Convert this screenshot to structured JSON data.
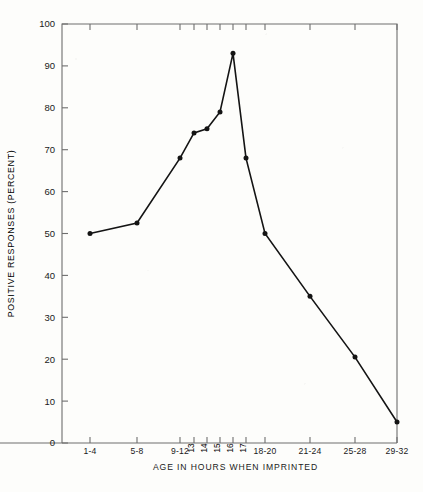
{
  "chart_data": {
    "type": "line",
    "title": "",
    "xlabel": "AGE IN HOURS WHEN IMPRINTED",
    "ylabel": "POSITIVE RESPONSES (PERCENT)",
    "ylim": [
      0,
      100
    ],
    "ytick_values": [
      0,
      10,
      20,
      30,
      40,
      50,
      60,
      70,
      80,
      90,
      100
    ],
    "ytick_labels": [
      "0",
      "10",
      "20",
      "30",
      "40",
      "50",
      "60",
      "70",
      "80",
      "90",
      "100"
    ],
    "grid": false,
    "legend": null,
    "categories": [
      "1-4",
      "5-8",
      "9-12",
      "13",
      "14",
      "15",
      "16",
      "17",
      "18-20",
      "21-24",
      "25-28",
      "29-32"
    ],
    "category_rotated": [
      false,
      false,
      false,
      true,
      true,
      true,
      true,
      true,
      false,
      false,
      false,
      false
    ],
    "values": [
      50,
      52.5,
      68,
      74,
      75,
      79,
      93,
      68,
      50,
      35,
      20.5,
      5
    ],
    "series": [
      {
        "name": "Positive responses",
        "values": [
          50,
          52.5,
          68,
          74,
          75,
          79,
          93,
          68,
          50,
          35,
          20.5,
          5
        ],
        "marker": "filled-circle",
        "color": "#141414"
      }
    ],
    "x_positions_px": [
      90,
      137,
      180,
      194,
      207,
      220,
      233,
      246,
      265,
      310,
      355,
      397
    ],
    "axis_px": {
      "left": 62,
      "right": 397,
      "top": 24,
      "bottom": 443
    }
  },
  "figure": {
    "axis_color": "#6e6e6e",
    "line_color": "#141414",
    "background": "#fdfdfb"
  }
}
